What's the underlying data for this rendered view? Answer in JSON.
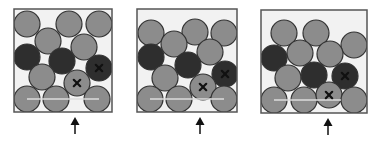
{
  "colors": {
    "background": "#ffffff",
    "box_border": "#555555",
    "box_fill": "#f2f2f2",
    "gray_particle": "#8c8c8c",
    "dark_particle": "#2e2e2e",
    "particle_stroke": "#333333",
    "baseline": "#dddddd",
    "mark": "#111111",
    "arrow": "#111111"
  },
  "particle_radius": 13,
  "panels": [
    {
      "id": "panel-1",
      "box": {
        "x": 14,
        "y": 9,
        "w": 98,
        "h": 103
      },
      "baseline": {
        "x1": 13,
        "x2": 85,
        "y": 90
      },
      "arrow": {
        "x": 75,
        "y_top": 117,
        "y_bottom": 134
      },
      "particles": [
        {
          "x": 13,
          "y": 15,
          "type": "gray"
        },
        {
          "x": 55,
          "y": 15,
          "type": "gray"
        },
        {
          "x": 85,
          "y": 15,
          "type": "gray"
        },
        {
          "x": 34,
          "y": 32,
          "type": "gray"
        },
        {
          "x": 70,
          "y": 38,
          "type": "gray"
        },
        {
          "x": 13,
          "y": 48,
          "type": "dark"
        },
        {
          "x": 48,
          "y": 52,
          "type": "dark"
        },
        {
          "x": 85,
          "y": 59,
          "type": "dark",
          "marked": true
        },
        {
          "x": 28,
          "y": 68,
          "type": "gray"
        },
        {
          "x": 63,
          "y": 74,
          "type": "gray",
          "marked": true
        },
        {
          "x": 13,
          "y": 90,
          "type": "gray"
        },
        {
          "x": 42,
          "y": 90,
          "type": "gray"
        },
        {
          "x": 83,
          "y": 90,
          "type": "gray"
        }
      ]
    },
    {
      "id": "panel-2",
      "box": {
        "x": 137,
        "y": 9,
        "w": 100,
        "h": 103
      },
      "baseline": {
        "x1": 13,
        "x2": 87,
        "y": 90
      },
      "arrow": {
        "x": 200,
        "y_top": 117,
        "y_bottom": 134
      },
      "particles": [
        {
          "x": 14,
          "y": 24,
          "type": "gray"
        },
        {
          "x": 58,
          "y": 23,
          "type": "gray"
        },
        {
          "x": 87,
          "y": 24,
          "type": "gray"
        },
        {
          "x": 37,
          "y": 35,
          "type": "gray"
        },
        {
          "x": 73,
          "y": 43,
          "type": "gray"
        },
        {
          "x": 14,
          "y": 48,
          "type": "dark"
        },
        {
          "x": 51,
          "y": 56,
          "type": "dark"
        },
        {
          "x": 88,
          "y": 65,
          "type": "dark",
          "marked": true
        },
        {
          "x": 28,
          "y": 69,
          "type": "gray"
        },
        {
          "x": 66,
          "y": 78,
          "type": "gray",
          "marked": true
        },
        {
          "x": 13,
          "y": 90,
          "type": "gray"
        },
        {
          "x": 42,
          "y": 90,
          "type": "gray"
        },
        {
          "x": 87,
          "y": 90,
          "type": "gray"
        }
      ]
    },
    {
      "id": "panel-3",
      "box": {
        "x": 261,
        "y": 10,
        "w": 106,
        "h": 103
      },
      "baseline": {
        "x1": 13,
        "x2": 80,
        "y": 90
      },
      "arrow": {
        "x": 328,
        "y_top": 118,
        "y_bottom": 135
      },
      "particles": [
        {
          "x": 23,
          "y": 23,
          "type": "gray"
        },
        {
          "x": 55,
          "y": 23,
          "type": "gray"
        },
        {
          "x": 93,
          "y": 35,
          "type": "gray"
        },
        {
          "x": 39,
          "y": 43,
          "type": "gray"
        },
        {
          "x": 69,
          "y": 44,
          "type": "gray"
        },
        {
          "x": 13,
          "y": 48,
          "type": "dark"
        },
        {
          "x": 27,
          "y": 68,
          "type": "gray"
        },
        {
          "x": 53,
          "y": 65,
          "type": "dark"
        },
        {
          "x": 84,
          "y": 66,
          "type": "dark",
          "marked": true
        },
        {
          "x": 13,
          "y": 90,
          "type": "gray"
        },
        {
          "x": 43,
          "y": 90,
          "type": "gray"
        },
        {
          "x": 68,
          "y": 85,
          "type": "gray",
          "marked": true
        },
        {
          "x": 93,
          "y": 90,
          "type": "gray"
        }
      ]
    }
  ]
}
